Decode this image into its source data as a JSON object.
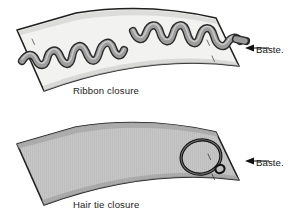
{
  "diagram": {
    "background_color": "#ffffff",
    "line_color": "#1a1a1a",
    "panels": [
      {
        "id": "ribbon-panel",
        "caption": "Ribbon closure",
        "fabric_fill": "#f2f2f0",
        "fabric_texture": "plain",
        "closure_type": "ribbon",
        "closure_color": "#9a9a9a",
        "closure_outline": "#2b2b2b",
        "callout": {
          "label": "Baste.",
          "arrow": "left-arrow-icon",
          "points_to": "right-edge"
        },
        "basting_marks": 4
      },
      {
        "id": "hairtie-panel",
        "caption": "Hair tie closure",
        "fabric_fill": "#c6c6c6",
        "fabric_texture": "striped",
        "closure_type": "hair-tie-loop",
        "closure_color": "#1a1a1a",
        "closure_outline": "#1a1a1a",
        "callout": {
          "label": "Baste.",
          "arrow": "left-arrow-icon",
          "points_to": "right-edge"
        },
        "basting_marks": 2
      }
    ]
  }
}
